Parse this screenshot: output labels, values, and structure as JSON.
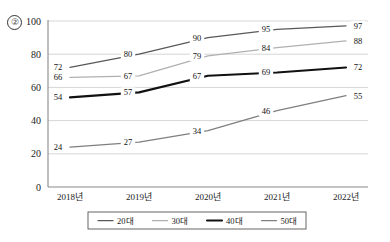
{
  "marker": {
    "label": "②"
  },
  "chart_data": {
    "type": "line",
    "title": "",
    "xlabel": "",
    "ylabel": "",
    "categories": [
      "2018년",
      "2019년",
      "2020년",
      "2021년",
      "2022년"
    ],
    "ylim": [
      0,
      100
    ],
    "yticks": [
      0,
      20,
      40,
      60,
      80,
      100
    ],
    "grid": true,
    "legend_position": "bottom",
    "series": [
      {
        "name": "20대",
        "values": [
          72,
          80,
          90,
          95,
          97
        ],
        "color": "#595959"
      },
      {
        "name": "30대",
        "values": [
          66,
          67,
          79,
          84,
          88
        ],
        "color": "#b0b0b0"
      },
      {
        "name": "40대",
        "values": [
          54,
          57,
          67,
          69,
          72
        ],
        "color": "#111111"
      },
      {
        "name": "50대",
        "values": [
          24,
          27,
          34,
          46,
          55
        ],
        "color": "#7f7f7f"
      }
    ]
  },
  "axis": {
    "y_labels": [
      "100",
      "80",
      "60",
      "40",
      "20",
      "0"
    ],
    "x_labels": [
      "2018년",
      "2019년",
      "2020년",
      "2021년",
      "2022년"
    ]
  },
  "legend": {
    "items": [
      {
        "label": "20대",
        "color": "#595959"
      },
      {
        "label": "30대",
        "color": "#b0b0b0"
      },
      {
        "label": "40대",
        "color": "#111111"
      },
      {
        "label": "50대",
        "color": "#7f7f7f"
      }
    ]
  },
  "data_labels": {
    "20대": [
      "72",
      "80",
      "90",
      "95",
      "97"
    ],
    "30대": [
      "66",
      "67",
      "79",
      "84",
      "88"
    ],
    "40대": [
      "54",
      "57",
      "67",
      "69",
      "72"
    ],
    "50대": [
      "24",
      "27",
      "34",
      "46",
      "55"
    ]
  }
}
